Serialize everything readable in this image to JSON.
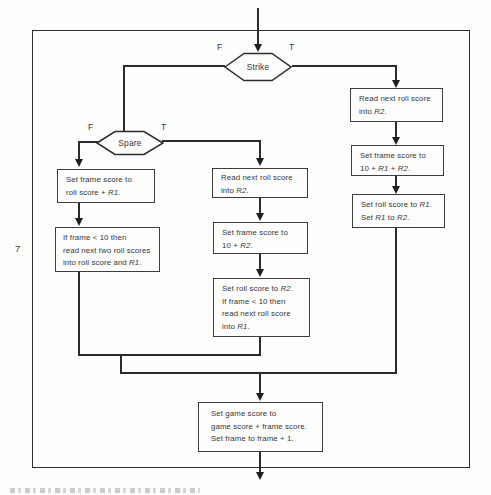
{
  "page": {
    "page_number": "7"
  },
  "flowchart": {
    "colors": {
      "line": "#2c2c2c",
      "box_border": "#3d3d3d",
      "background": "#fdfdfc",
      "text": "#363636"
    },
    "decisions": {
      "strike": {
        "label": "Strike",
        "false_label": "F",
        "true_label": "T"
      },
      "spare": {
        "label": "Spare",
        "false_label": "F",
        "true_label": "T"
      }
    },
    "nodes": {
      "strike_read_r2": {
        "lines": [
          [
            {
              "t": "Read next roll score"
            }
          ],
          [
            {
              "t": "into "
            },
            {
              "t": "R2",
              "i": 1
            },
            {
              "t": "."
            }
          ]
        ]
      },
      "strike_frame_score": {
        "lines": [
          [
            {
              "t": "Set frame score to"
            }
          ],
          [
            {
              "t": "10 + "
            },
            {
              "t": "R1",
              "i": 1
            },
            {
              "t": " + "
            },
            {
              "t": "R2",
              "i": 1
            },
            {
              "t": "."
            }
          ]
        ]
      },
      "strike_roll_score": {
        "lines": [
          [
            {
              "t": "Set roll score to "
            },
            {
              "t": "R1",
              "i": 1
            },
            {
              "t": "."
            }
          ],
          [
            {
              "t": "Set "
            },
            {
              "t": "R1",
              "i": 1
            },
            {
              "t": " to "
            },
            {
              "t": "R2",
              "i": 1
            },
            {
              "t": "."
            }
          ]
        ]
      },
      "spare_read_r2": {
        "lines": [
          [
            {
              "t": "Read next roll score"
            }
          ],
          [
            {
              "t": "into "
            },
            {
              "t": "R2",
              "i": 1
            },
            {
              "t": "."
            }
          ]
        ]
      },
      "spare_frame_score": {
        "lines": [
          [
            {
              "t": "Set frame score to"
            }
          ],
          [
            {
              "t": "10 + "
            },
            {
              "t": "R2",
              "i": 1
            },
            {
              "t": "."
            }
          ]
        ]
      },
      "spare_roll_score": {
        "lines": [
          [
            {
              "t": "Set roll score to "
            },
            {
              "t": "R2",
              "i": 1
            },
            {
              "t": "."
            }
          ],
          [
            {
              "t": "If frame < 10 then"
            }
          ],
          [
            {
              "t": "read next roll score"
            }
          ],
          [
            {
              "t": "into "
            },
            {
              "t": "R1",
              "i": 1
            },
            {
              "t": "."
            }
          ]
        ]
      },
      "open_frame_score": {
        "lines": [
          [
            {
              "t": "Set frame score to"
            }
          ],
          [
            {
              "t": "roll score + "
            },
            {
              "t": "R1",
              "i": 1
            },
            {
              "t": "."
            }
          ]
        ]
      },
      "open_read_two": {
        "lines": [
          [
            {
              "t": "If frame < 10 then"
            }
          ],
          [
            {
              "t": "read next two roll scores"
            }
          ],
          [
            {
              "t": "into roll score and "
            },
            {
              "t": "R1",
              "i": 1
            },
            {
              "t": "."
            }
          ]
        ]
      },
      "game_score": {
        "lines": [
          [
            {
              "t": "Set game score to"
            }
          ],
          [
            {
              "t": "game score + frame score."
            }
          ],
          [
            {
              "t": "Set frame to frame + 1."
            }
          ]
        ]
      }
    }
  }
}
